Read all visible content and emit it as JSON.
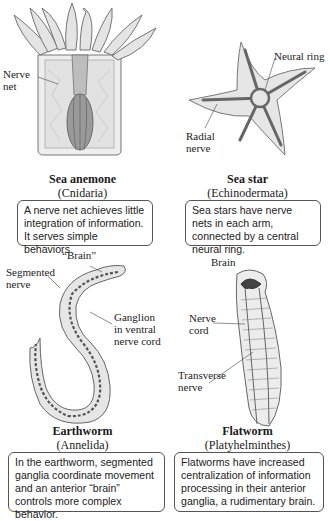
{
  "panels": [
    {
      "name": "Sea anemone",
      "taxon": "(Cnidaria)",
      "labels": [
        "Nerve net"
      ],
      "description": "A nerve net achieves little integration of information. It serves simple behaviors."
    },
    {
      "name": "Sea star",
      "taxon": "(Echinodermata)",
      "labels": [
        "Neural ring",
        "Radial nerve"
      ],
      "description": "Sea stars have nerve nets in each arm, connected by a central neural ring."
    },
    {
      "name": "Earthworm",
      "taxon": "(Annelida)",
      "labels": [
        "“Brain”",
        "Segmented nerve",
        "Ganglion in ventral nerve cord"
      ],
      "description": "In the earthworm, segmented ganglia coordinate movement and an anterior “brain” controls more complex behavior."
    },
    {
      "name": "Flatworm",
      "taxon": "(Platyhelminthes)",
      "labels": [
        "Brain",
        "Nerve cord",
        "Transverse nerve"
      ],
      "description": "Flatworms have increased centralization of information processing in their anterior ganglia, a rudimentary brain."
    }
  ],
  "label_lines": {
    "nerve_net_1": "Nerve",
    "nerve_net_2": "net",
    "neural_ring": "Neural ring",
    "radial_1": "Radial",
    "radial_2": "nerve",
    "brain_quoted": "“Brain”",
    "segmented_1": "Segmented",
    "segmented_2": "nerve",
    "ganglion_1": "Ganglion",
    "ganglion_2": "in ventral",
    "ganglion_3": "nerve cord",
    "brain": "Brain",
    "nerve_cord_1": "Nerve",
    "nerve_cord_2": "cord",
    "transverse_1": "Transverse",
    "transverse_2": "nerve"
  }
}
